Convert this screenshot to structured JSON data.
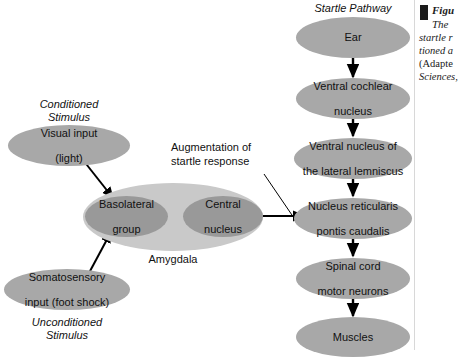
{
  "figure": {
    "background": "#ffffff",
    "node_fill_mid": "#a8a8a8",
    "node_fill_dark": "#999999",
    "node_fill_pale": "#c9c9c9",
    "arrow_color": "#000000"
  },
  "titles": {
    "startle_pathway": "Startle Pathway"
  },
  "left_panel": {
    "conditioned_stimulus_label": "Conditioned\nStimulus",
    "conditioned_stimulus_line1": "Conditioned",
    "conditioned_stimulus_line2": "Stimulus",
    "unconditioned_stimulus_line1": "Unconditioned",
    "unconditioned_stimulus_line2": "Stimulus",
    "visual_input_line1": "Visual input",
    "visual_input_line2": "(light)",
    "somatosensory_line1": "Somatosensory",
    "somatosensory_line2": "input (foot shock)",
    "amygdala_label": "Amygdala",
    "basolateral_line1": "Basolateral",
    "basolateral_line2": "group",
    "central_line1": "Central",
    "central_line2": "nucleus"
  },
  "annotation": {
    "augmentation_line1": "Augmentation of",
    "augmentation_line2": "startle response"
  },
  "startle_pathway_nodes": [
    {
      "id": "ear",
      "line1": "Ear",
      "line2": ""
    },
    {
      "id": "ventral-cochlear-nucleus",
      "line1": "Ventral cochlear",
      "line2": "nucleus"
    },
    {
      "id": "ventral-nucleus-lateral-lemniscus",
      "line1": "Ventral nucleus of",
      "line2": "the lateral lemniscus"
    },
    {
      "id": "nucleus-reticularis-pontis-caudalis",
      "line1": "Nucleus reticularis",
      "line2": "pontis caudalis"
    },
    {
      "id": "spinal-cord-motor-neurons",
      "line1": "Spinal cord",
      "line2": "motor neurons"
    },
    {
      "id": "muscles",
      "line1": "Muscles",
      "line2": ""
    }
  ],
  "caption": {
    "figure_word": "Figu",
    "line1": "The",
    "line2": "startle r",
    "line3": "tioned a",
    "line4": "(Adapte",
    "line5": "Sciences,"
  }
}
